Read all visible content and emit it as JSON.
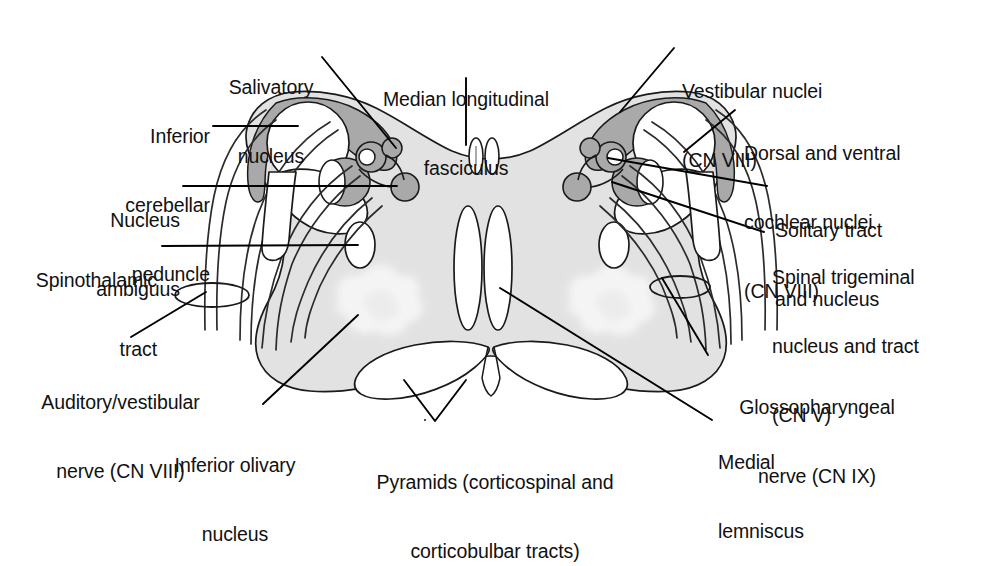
{
  "figure": {
    "kind": "anatomical-cross-section",
    "colors": {
      "background": "#ffffff",
      "parenchyma_fill": "#e2e2e2",
      "nucleus_fill": "#a9a9a9",
      "white_fill": "#ffffff",
      "outline": "#1a1a1a",
      "leader_line": "#000000",
      "reticular_mottle": "#f3f3f3"
    }
  },
  "labels": {
    "salivatory_nucleus": {
      "line1": "Salivatory",
      "line2": "nucleus"
    },
    "inferior_cerebellar_peduncle": {
      "line1": "Inferior",
      "line2": "cerebellar",
      "line3": "peduncle"
    },
    "nucleus_ambiguus": {
      "line1": "Nucleus",
      "line2": "ambiguus"
    },
    "spinothalamic_tract": {
      "line1": "Spinothalamic",
      "line2": "tract"
    },
    "auditory_vestibular_nerve": {
      "line1": "Auditory/vestibular",
      "line2": "nerve (CN VIII)"
    },
    "inferior_olivary_nucleus": {
      "line1": "Inferior olivary",
      "line2": "nucleus"
    },
    "pyramids": {
      "line1": "Pyramids (corticospinal and",
      "line2": "corticobulbar tracts)"
    },
    "median_longitudinal_fasciculus": {
      "line1": "Median longitudinal",
      "line2": "fasciculus"
    },
    "vestibular_nuclei": {
      "line1": "Vestibular nuclei",
      "line2": "(CN VIII)"
    },
    "dorsal_ventral_cochlear_nuclei": {
      "line1": "Dorsal and ventral",
      "line2": "cochlear nuclei",
      "line3": "(CN VIII)"
    },
    "solitary_tract_and_nucleus": {
      "line1": "Solitary tract",
      "line2": "and nucleus"
    },
    "spinal_trigeminal_nucleus_and_tract": {
      "line1": "Spinal trigeminal",
      "line2": "nucleus and tract",
      "line3": "(CN V)"
    },
    "glossopharyngeal_nerve": {
      "line1": "Glossopharyngeal",
      "line2": "nerve (CN IX)"
    },
    "medial_lemniscus": {
      "line1": "Medial",
      "line2": "lemniscus"
    }
  }
}
